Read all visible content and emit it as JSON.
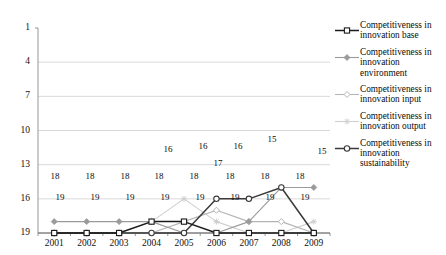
{
  "chart_data": {
    "type": "line",
    "title": "",
    "xlabel": "",
    "ylabel": "",
    "categories": [
      "2001",
      "2002",
      "2003",
      "2004",
      "2005",
      "2006",
      "2007",
      "2008",
      "2009"
    ],
    "ylim": [
      1,
      19
    ],
    "y_inverted": true,
    "yticks": [
      1,
      4,
      7,
      10,
      13,
      16,
      19
    ],
    "grid": true,
    "legend_position": "right",
    "series": [
      {
        "name": "Competitiveness in innovation base",
        "marker": "square",
        "color": "#1a1a1a",
        "values": [
          19,
          19,
          19,
          18,
          18,
          19,
          19,
          19,
          19
        ],
        "labels": [
          "19",
          "19",
          "19",
          "18",
          "18",
          "19",
          "19",
          "19",
          "19"
        ]
      },
      {
        "name": "Competitiveness in innovation environment",
        "marker": "diamond",
        "color": "#9a9a9a",
        "values": [
          18,
          18,
          18,
          18,
          19,
          19,
          18,
          15,
          15
        ],
        "labels": [
          "18",
          "18",
          "18",
          "18",
          "19",
          "",
          "",
          "15",
          "15"
        ]
      },
      {
        "name": "Competitiveness in innovation input",
        "marker": "diamond-open",
        "color": "#b5b5b5",
        "values": [
          19,
          19,
          19,
          19,
          18,
          17,
          18,
          18,
          19
        ],
        "labels": [
          "",
          "",
          "",
          "",
          "",
          "17",
          "18",
          "18",
          ""
        ]
      },
      {
        "name": "Competitiveness in innovation output",
        "marker": "star",
        "color": "#cfcfcf",
        "values": [
          19,
          19,
          19,
          18,
          16,
          18,
          19,
          19,
          18
        ],
        "labels": [
          "",
          "",
          "",
          "",
          "16",
          "",
          "",
          "",
          "18"
        ]
      },
      {
        "name": "Competitiveness in innovation sustainability",
        "marker": "circle",
        "color": "#3a3a3a",
        "values": [
          19,
          19,
          19,
          19,
          19,
          16,
          16,
          15,
          19
        ],
        "labels": [
          "",
          "",
          "",
          "",
          "",
          "16",
          "16",
          "15",
          "19"
        ]
      }
    ],
    "point_labels": [
      {
        "text": "18",
        "x": 55,
        "y": 177
      },
      {
        "text": "18",
        "x": 90,
        "y": 177
      },
      {
        "text": "18",
        "x": 125,
        "y": 177
      },
      {
        "text": "18",
        "x": 159,
        "y": 177
      },
      {
        "text": "18",
        "x": 194,
        "y": 177
      },
      {
        "text": "19",
        "x": 60,
        "y": 198
      },
      {
        "text": "19",
        "x": 95,
        "y": 198
      },
      {
        "text": "19",
        "x": 130,
        "y": 198
      },
      {
        "text": "19",
        "x": 165,
        "y": 198
      },
      {
        "text": "19",
        "x": 200,
        "y": 198
      },
      {
        "text": "16",
        "x": 168,
        "y": 150
      },
      {
        "text": "16",
        "x": 203,
        "y": 147
      },
      {
        "text": "17",
        "x": 218,
        "y": 164
      },
      {
        "text": "16",
        "x": 238,
        "y": 147
      },
      {
        "text": "18",
        "x": 230,
        "y": 177
      },
      {
        "text": "19",
        "x": 235,
        "y": 198
      },
      {
        "text": "15",
        "x": 272,
        "y": 140
      },
      {
        "text": "18",
        "x": 265,
        "y": 177
      },
      {
        "text": "19",
        "x": 270,
        "y": 198
      },
      {
        "text": "15",
        "x": 322,
        "y": 152
      },
      {
        "text": "18",
        "x": 300,
        "y": 177
      },
      {
        "text": "19",
        "x": 305,
        "y": 198
      }
    ]
  },
  "legend": {
    "items": [
      {
        "label": "Competitiveness in innovation base",
        "marker": "square",
        "color": "#1a1a1a"
      },
      {
        "label": "Competitiveness in innovation environment",
        "marker": "diamond",
        "color": "#9a9a9a"
      },
      {
        "label": "Competitiveness in innovation input",
        "marker": "diamond-open",
        "color": "#b5b5b5"
      },
      {
        "label": "Competitiveness in innovation output",
        "marker": "star",
        "color": "#cfcfcf"
      },
      {
        "label": "Competitiveness in innovation sustainability",
        "marker": "circle",
        "color": "#3a3a3a"
      }
    ]
  },
  "axes": {
    "y_labels": [
      "1",
      "4",
      "7",
      "10",
      "13",
      "16",
      "19"
    ],
    "x_labels": [
      "2001",
      "2002",
      "2003",
      "2004",
      "2005",
      "2006",
      "2007",
      "2008",
      "2009"
    ]
  }
}
